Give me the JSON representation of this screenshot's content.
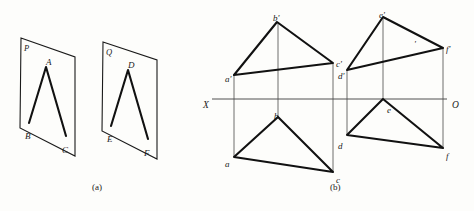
{
  "figure": {
    "caption_a": "(a)",
    "caption_b": "(b)",
    "background_color": "#fdfdfb",
    "ink_color": "#1a1a1a",
    "thin_line_color": "#4a4a4a"
  },
  "panel_a": {
    "plane_p": {
      "label": "P",
      "label_x": 24,
      "label_y": 44,
      "corners": [
        [
          21,
          38
        ],
        [
          75,
          57
        ],
        [
          75,
          156
        ],
        [
          20,
          128
        ]
      ],
      "triangle": {
        "vertices": {
          "A": [
            46,
            67
          ],
          "B": [
            29,
            123
          ],
          "C": [
            66,
            136
          ]
        },
        "labels": [
          {
            "text": "A",
            "x": 46,
            "y": 58
          },
          {
            "text": "B",
            "x": 25,
            "y": 132
          },
          {
            "text": "C",
            "x": 62,
            "y": 146
          }
        ]
      }
    },
    "plane_q": {
      "label": "Q",
      "label_x": 106,
      "label_y": 48,
      "corners": [
        [
          103,
          42
        ],
        [
          157,
          60
        ],
        [
          157,
          159
        ],
        [
          102,
          131
        ]
      ],
      "triangle": {
        "vertices": {
          "D": [
            128,
            70
          ],
          "E": [
            111,
            126
          ],
          "F": [
            148,
            139
          ]
        },
        "labels": [
          {
            "text": "D",
            "x": 128,
            "y": 61
          },
          {
            "text": "E",
            "x": 107,
            "y": 135
          },
          {
            "text": "F",
            "x": 144,
            "y": 149
          }
        ]
      }
    }
  },
  "panel_b": {
    "axis": {
      "label_left": "X",
      "label_right": "O",
      "label_left_x": 203,
      "label_left_y": 101,
      "label_right_x": 452,
      "label_right_y": 101,
      "x_start": 212,
      "x_end": 447,
      "y": 99
    },
    "group_abc": {
      "front_view": {
        "vertices": {
          "a_prime": [
            234,
            75
          ],
          "b_prime": [
            277,
            22
          ],
          "c_prime": [
            333,
            63
          ]
        },
        "labels": [
          {
            "text": "a'",
            "x": 225,
            "y": 75
          },
          {
            "text": "b'",
            "x": 273,
            "y": 14
          },
          {
            "text": "c'",
            "x": 336,
            "y": 60
          }
        ]
      },
      "top_view": {
        "vertices": {
          "a": [
            234,
            157
          ],
          "b": [
            278,
            117
          ],
          "c": [
            333,
            172
          ]
        },
        "labels": [
          {
            "text": "a",
            "x": 225,
            "y": 160
          },
          {
            "text": "b",
            "x": 274,
            "y": 112
          },
          {
            "text": "c",
            "x": 336,
            "y": 176
          }
        ]
      },
      "projection_lines": [
        {
          "x": 234,
          "y1": 75,
          "y2": 157
        },
        {
          "x": 278,
          "y1": 22,
          "y2": 117
        },
        {
          "x": 333,
          "y1": 63,
          "y2": 172
        }
      ]
    },
    "group_def": {
      "front_view": {
        "vertices": {
          "d_prime": [
            347,
            70
          ],
          "e_prime": [
            383,
            17
          ],
          "f_prime": [
            443,
            48
          ]
        },
        "labels": [
          {
            "text": "d'",
            "x": 338,
            "y": 72
          },
          {
            "text": "e'",
            "x": 379,
            "y": 11
          },
          {
            "text": "f'",
            "x": 446,
            "y": 45
          },
          {
            "text": "'",
            "x": 414,
            "y": 40
          }
        ]
      },
      "top_view": {
        "vertices": {
          "d": [
            347,
            135
          ],
          "e": [
            383,
            99
          ],
          "f": [
            443,
            148
          ]
        },
        "labels": [
          {
            "text": "d",
            "x": 338,
            "y": 142
          },
          {
            "text": "e",
            "x": 387,
            "y": 106
          },
          {
            "text": "f",
            "x": 446,
            "y": 152
          }
        ]
      },
      "projection_lines": [
        {
          "x": 347,
          "y1": 70,
          "y2": 135
        },
        {
          "x": 383,
          "y1": 17,
          "y2": 99
        },
        {
          "x": 443,
          "y1": 48,
          "y2": 148
        }
      ]
    }
  }
}
